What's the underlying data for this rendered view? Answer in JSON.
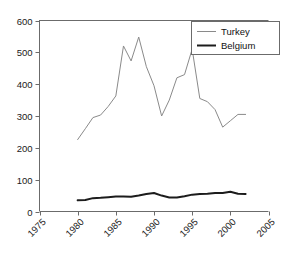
{
  "chart_data": {
    "type": "line",
    "title": "",
    "xlabel": "",
    "ylabel": "",
    "xlim": [
      1975,
      2005
    ],
    "ylim": [
      0,
      600
    ],
    "xticks": [
      "1975",
      "1980",
      "1985",
      "1990",
      "1995",
      "2000",
      "2005"
    ],
    "yticks": [
      "0",
      "100",
      "200",
      "300",
      "400",
      "500",
      "600"
    ],
    "grid": false,
    "legend_position": "top-right",
    "series": [
      {
        "name": "Turkey",
        "color": "#8a8a8a",
        "x": [
          1980,
          1981,
          1982,
          1983,
          1984,
          1985,
          1986,
          1987,
          1988,
          1989,
          1990,
          1991,
          1992,
          1993,
          1994,
          1995,
          1996,
          1997,
          1998,
          1999,
          2000,
          2001,
          2002
        ],
        "values": [
          226,
          260,
          295,
          303,
          330,
          363,
          520,
          473,
          548,
          455,
          395,
          300,
          350,
          420,
          430,
          510,
          355,
          345,
          320,
          265,
          285,
          305,
          305
        ]
      },
      {
        "name": "Belgium",
        "color": "#1c1c1c",
        "x": [
          1980,
          1981,
          1982,
          1983,
          1984,
          1985,
          1986,
          1987,
          1988,
          1989,
          1990,
          1991,
          1992,
          1993,
          1994,
          1995,
          1996,
          1997,
          1998,
          1999,
          2000,
          2001,
          2002
        ],
        "values": [
          35,
          36,
          42,
          43,
          45,
          47,
          47,
          46,
          50,
          55,
          58,
          50,
          44,
          44,
          48,
          53,
          55,
          56,
          58,
          58,
          62,
          56,
          55
        ]
      }
    ]
  },
  "legend": {
    "items": [
      {
        "label": "Turkey"
      },
      {
        "label": "Belgium"
      }
    ]
  }
}
